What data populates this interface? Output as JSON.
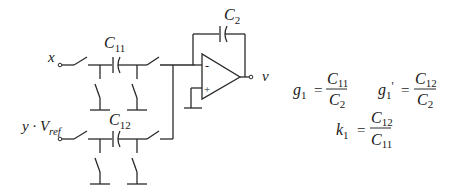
{
  "diagram": {
    "inputs": [
      {
        "id": "x",
        "label": "x"
      },
      {
        "id": "yvref",
        "label_main": "y · V",
        "label_sub": "ref"
      }
    ],
    "output": {
      "label": "v"
    },
    "capacitors": [
      {
        "id": "C11",
        "main": "C",
        "sub": "11"
      },
      {
        "id": "C12",
        "main": "C",
        "sub": "12"
      },
      {
        "id": "C2",
        "main": "C",
        "sub": "2"
      }
    ],
    "opamp": {
      "minus": "-",
      "plus": "+"
    },
    "colors": {
      "ink": "#2a2a2a",
      "background": "#ffffff"
    }
  },
  "equations": {
    "g1": {
      "lhs_main": "g",
      "lhs_sub": "1",
      "eq": "=",
      "num_main": "C",
      "num_sub": "11",
      "den_main": "C",
      "den_sub": "2"
    },
    "g1p": {
      "lhs_main": "g",
      "lhs_sub": "1",
      "prime": "'",
      "eq": "=",
      "num_main": "C",
      "num_sub": "12",
      "den_main": "C",
      "den_sub": "2"
    },
    "k1": {
      "lhs_main": "k",
      "lhs_sub": "1",
      "eq": "=",
      "num_main": "C",
      "num_sub": "12",
      "den_main": "C",
      "den_sub": "11"
    }
  }
}
